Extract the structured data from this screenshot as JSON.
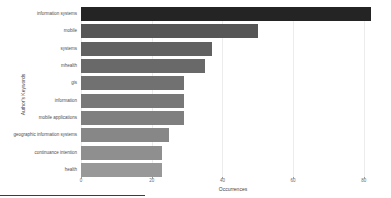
{
  "chart_data": {
    "type": "bar",
    "orientation": "horizontal",
    "title": "",
    "categories": [
      "information systems",
      "mobile",
      "systems",
      "mhealth",
      "gis",
      "information",
      "mobile applications",
      "geographic information systems",
      "continuance intention",
      "health"
    ],
    "values": [
      82,
      50,
      37,
      35,
      29,
      29,
      29,
      25,
      23,
      23
    ],
    "xlabel": "Occurrences",
    "ylabel": "Author's Keywords",
    "xlim": [
      0,
      86
    ],
    "xticks": [
      0,
      20,
      40,
      60,
      80
    ],
    "grid": true,
    "legend": "none",
    "bar_colors": [
      "#242424",
      "#565656",
      "#616161",
      "#696969",
      "#717171",
      "#787878",
      "#7f7f7f",
      "#878787",
      "#8f8f8f",
      "#989898"
    ],
    "grid_color": "#ececec",
    "axis_text_color": "#6b6b6b",
    "label_text_color": "#4d4d4d"
  }
}
